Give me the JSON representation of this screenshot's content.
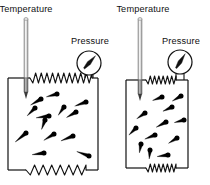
{
  "figure": {
    "background_color": "#ffffff",
    "line_color": "#111111",
    "particle_color": "#000000",
    "width": 210,
    "height": 185
  },
  "panels": [
    {
      "id": "left",
      "name": "expanded-gas-container",
      "state_label": "expanded",
      "temperature_label": "Temperature",
      "pressure_label": "Pressure",
      "container": {
        "x": 8,
        "y": 78,
        "width": 90,
        "height": 92
      },
      "thermometer": {
        "x": 26,
        "top": 18,
        "bottom": 92,
        "bulb_height": 14,
        "width": 4
      },
      "gauge": {
        "cx": 89,
        "cy": 63,
        "r": 12,
        "needle_angle_deg": -48
      },
      "top_spring": {
        "x1": 30,
        "x2": 92,
        "y": 78,
        "coils": 11,
        "amplitude": 5
      },
      "bottom_spring": {
        "x1": 26,
        "x2": 86,
        "y": 170,
        "coils": 7,
        "amplitude": 5
      },
      "particle_count": 13,
      "particles": [
        {
          "x": 41,
          "y": 99,
          "angle": 150,
          "trail": 12
        },
        {
          "x": 57,
          "y": 94,
          "angle": 165,
          "trail": 11
        },
        {
          "x": 86,
          "y": 102,
          "angle": 160,
          "trail": 12
        },
        {
          "x": 49,
          "y": 116,
          "angle": 172,
          "trail": 13
        },
        {
          "x": 76,
          "y": 112,
          "angle": 150,
          "trail": 11
        },
        {
          "x": 26,
          "y": 133,
          "angle": 140,
          "trail": 14
        },
        {
          "x": 54,
          "y": 134,
          "angle": 148,
          "trail": 12
        },
        {
          "x": 73,
          "y": 136,
          "angle": 158,
          "trail": 13
        },
        {
          "x": 45,
          "y": 120,
          "angle": 110,
          "trail": 10
        },
        {
          "x": 44,
          "y": 153,
          "angle": 172,
          "trail": 12
        },
        {
          "x": 89,
          "y": 156,
          "angle": 200,
          "trail": 13
        },
        {
          "x": 64,
          "y": 107,
          "angle": 125,
          "trail": 10
        },
        {
          "x": 35,
          "y": 108,
          "angle": 135,
          "trail": 11
        }
      ]
    },
    {
      "id": "right",
      "name": "compressed-gas-container",
      "state_label": "compressed",
      "temperature_label": "Temperature",
      "pressure_label": "Pressure",
      "container": {
        "x": 126,
        "y": 80,
        "width": 62,
        "height": 88
      },
      "thermometer": {
        "x": 140,
        "top": 18,
        "bottom": 94,
        "bulb_height": 14,
        "width": 4
      },
      "gauge": {
        "cx": 180,
        "cy": 62,
        "r": 12,
        "needle_angle_deg": -58
      },
      "top_spring": {
        "x1": 146,
        "x2": 176,
        "y": 80,
        "coils": 7,
        "amplitude": 4
      },
      "bottom_spring": {
        "x1": 146,
        "x2": 176,
        "y": 168,
        "coils": 7,
        "amplitude": 4
      },
      "particle_count": 12,
      "particles": [
        {
          "x": 162,
          "y": 97,
          "angle": 160,
          "trail": 10
        },
        {
          "x": 181,
          "y": 96,
          "angle": 150,
          "trail": 10
        },
        {
          "x": 172,
          "y": 107,
          "angle": 155,
          "trail": 10
        },
        {
          "x": 145,
          "y": 113,
          "angle": 145,
          "trail": 10
        },
        {
          "x": 166,
          "y": 122,
          "angle": 152,
          "trail": 11
        },
        {
          "x": 184,
          "y": 120,
          "angle": 165,
          "trail": 10
        },
        {
          "x": 136,
          "y": 128,
          "angle": 135,
          "trail": 10
        },
        {
          "x": 155,
          "y": 135,
          "angle": 158,
          "trail": 11
        },
        {
          "x": 177,
          "y": 138,
          "angle": 148,
          "trail": 10
        },
        {
          "x": 150,
          "y": 150,
          "angle": 95,
          "trail": 9
        },
        {
          "x": 168,
          "y": 155,
          "angle": 172,
          "trail": 11
        },
        {
          "x": 141,
          "y": 144,
          "angle": 100,
          "trail": 9
        }
      ]
    }
  ]
}
